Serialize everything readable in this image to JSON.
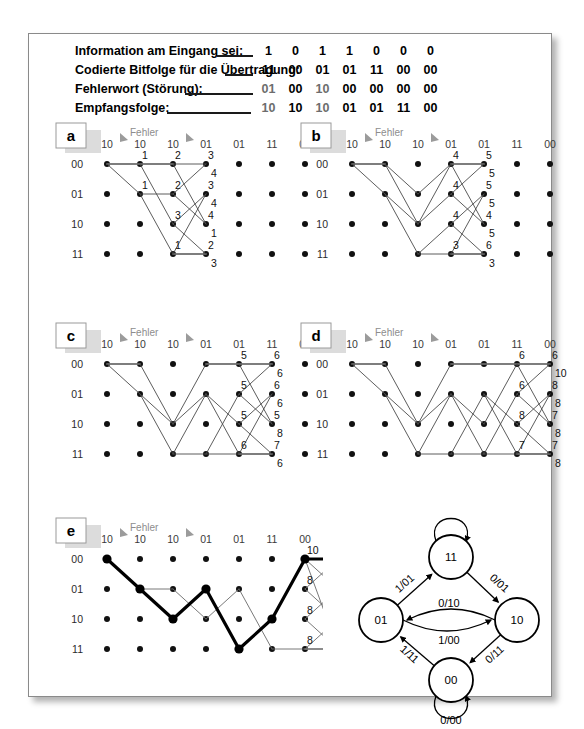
{
  "figure": {
    "legend": {
      "rows": [
        {
          "label": "Information am Eingang sei:",
          "values": [
            "1",
            "0",
            "1",
            "1",
            "0",
            "0",
            "0"
          ],
          "grey": false
        },
        {
          "label": "Codierte Bitfolge für die Übertragung:",
          "values": [
            "11",
            "00",
            "01",
            "01",
            "11",
            "00",
            "00"
          ],
          "grey": false
        },
        {
          "label": "Fehlerwort  (Störung):",
          "values": [
            "01",
            "00",
            "10",
            "00",
            "00",
            "00",
            "00"
          ],
          "grey": true
        },
        {
          "label": "Empfangsfolge:",
          "values": [
            "10",
            "10",
            "10",
            "01",
            "01",
            "11",
            "00"
          ],
          "grey": true
        }
      ]
    },
    "common": {
      "received_sequence": [
        "10",
        "10",
        "10",
        "01",
        "01",
        "11",
        "00"
      ],
      "state_labels": [
        "00",
        "01",
        "10",
        "11"
      ],
      "error_marker_label": "Fehler",
      "error_marker_columns": [
        0,
        2
      ]
    },
    "panels": [
      {
        "tag": "a",
        "metrics": [
          {
            "col": 1,
            "state": 0,
            "value": "1"
          },
          {
            "col": 1,
            "state": 1,
            "value": "1"
          },
          {
            "col": 2,
            "state": 0,
            "value": "2"
          },
          {
            "col": 2,
            "state": 1,
            "value": "2"
          },
          {
            "col": 2,
            "state": 2,
            "value": "3"
          },
          {
            "col": 2,
            "state": 3,
            "value": "1"
          },
          {
            "col": 3,
            "state": 0,
            "value": "3",
            "value2": "4"
          },
          {
            "col": 3,
            "state": 1,
            "value": "3",
            "value2": "4"
          },
          {
            "col": 3,
            "state": 2,
            "value": "4",
            "value2": "1"
          },
          {
            "col": 3,
            "state": 3,
            "value": "2",
            "value2": "3"
          }
        ],
        "nodes": [
          [
            0
          ],
          [
            0,
            1
          ],
          [
            0,
            1,
            2,
            3
          ],
          [
            0,
            1,
            2,
            3
          ]
        ],
        "edges": [
          [
            0,
            0,
            1,
            0
          ],
          [
            0,
            0,
            1,
            1
          ],
          [
            1,
            0,
            2,
            0
          ],
          [
            1,
            0,
            2,
            2
          ],
          [
            1,
            1,
            2,
            1
          ],
          [
            1,
            1,
            2,
            3
          ],
          [
            2,
            0,
            3,
            0
          ],
          [
            2,
            0,
            3,
            2
          ],
          [
            2,
            1,
            3,
            0
          ],
          [
            2,
            1,
            3,
            2
          ],
          [
            2,
            2,
            3,
            1
          ],
          [
            2,
            2,
            3,
            3
          ],
          [
            2,
            3,
            3,
            1
          ],
          [
            2,
            3,
            3,
            3
          ]
        ],
        "flat_edges": [
          [
            0,
            0,
            1,
            0
          ],
          [
            1,
            0,
            2,
            0
          ],
          [
            2,
            3,
            3,
            3
          ]
        ]
      },
      {
        "tag": "b",
        "metrics": [
          {
            "col": 3,
            "state": 0,
            "value": "4"
          },
          {
            "col": 3,
            "state": 1,
            "value": "4"
          },
          {
            "col": 3,
            "state": 2,
            "value": "4"
          },
          {
            "col": 3,
            "state": 3,
            "value": "3"
          },
          {
            "col": 4,
            "state": 0,
            "value": "5",
            "value2": "5"
          },
          {
            "col": 4,
            "state": 1,
            "value": "5",
            "value2": "5"
          },
          {
            "col": 4,
            "state": 2,
            "value": "4",
            "value2": "5"
          },
          {
            "col": 4,
            "state": 3,
            "value": "6",
            "value2": "3"
          }
        ],
        "nodes": [
          [
            0
          ],
          [
            0,
            1
          ],
          [
            0,
            1,
            2,
            3
          ],
          [
            0,
            1,
            2,
            3
          ],
          [
            0,
            1,
            2,
            3
          ]
        ],
        "edges": [
          [
            0,
            0,
            1,
            0
          ],
          [
            0,
            0,
            1,
            1
          ],
          [
            1,
            0,
            2,
            1
          ],
          [
            1,
            0,
            2,
            2
          ],
          [
            1,
            1,
            2,
            2
          ],
          [
            1,
            1,
            2,
            3
          ],
          [
            2,
            1,
            3,
            0
          ],
          [
            2,
            2,
            3,
            0
          ],
          [
            2,
            2,
            3,
            1
          ],
          [
            2,
            3,
            3,
            2
          ],
          [
            2,
            3,
            3,
            3
          ],
          [
            3,
            0,
            4,
            0
          ],
          [
            3,
            0,
            4,
            2
          ],
          [
            3,
            1,
            4,
            0
          ],
          [
            3,
            1,
            4,
            2
          ],
          [
            3,
            2,
            4,
            1
          ],
          [
            3,
            2,
            4,
            3
          ],
          [
            3,
            3,
            4,
            1
          ],
          [
            3,
            3,
            4,
            3
          ]
        ],
        "flat_edges": [
          [
            0,
            0,
            1,
            0
          ],
          [
            3,
            0,
            4,
            0
          ],
          [
            3,
            3,
            4,
            3
          ]
        ]
      },
      {
        "tag": "c",
        "metrics": [
          {
            "col": 4,
            "state": 0,
            "value": "5"
          },
          {
            "col": 4,
            "state": 1,
            "value": "5"
          },
          {
            "col": 4,
            "state": 2,
            "value": "5"
          },
          {
            "col": 4,
            "state": 3,
            "value": "6"
          },
          {
            "col": 5,
            "state": 0,
            "value": "6",
            "value2": "6"
          },
          {
            "col": 5,
            "state": 1,
            "value": "6",
            "value2": "6"
          },
          {
            "col": 5,
            "state": 2,
            "value": "5",
            "value2": "8"
          },
          {
            "col": 5,
            "state": 3,
            "value": "7",
            "value2": "6"
          }
        ],
        "nodes": [
          [
            0
          ],
          [
            0,
            1
          ],
          [
            0,
            1,
            2,
            3
          ],
          [
            0,
            1,
            2,
            3
          ],
          [
            0,
            1,
            2,
            3
          ],
          [
            0,
            1,
            2,
            3
          ]
        ],
        "edges": [
          [
            0,
            0,
            1,
            0
          ],
          [
            0,
            0,
            1,
            1
          ],
          [
            1,
            0,
            2,
            2
          ],
          [
            1,
            1,
            2,
            2
          ],
          [
            1,
            1,
            2,
            3
          ],
          [
            2,
            2,
            3,
            0
          ],
          [
            2,
            2,
            3,
            1
          ],
          [
            2,
            3,
            3,
            1
          ],
          [
            2,
            3,
            3,
            3
          ],
          [
            3,
            0,
            4,
            0
          ],
          [
            3,
            1,
            4,
            2
          ],
          [
            3,
            1,
            4,
            3
          ],
          [
            3,
            3,
            4,
            1
          ],
          [
            3,
            3,
            4,
            3
          ],
          [
            4,
            0,
            5,
            0
          ],
          [
            4,
            0,
            5,
            2
          ],
          [
            4,
            1,
            5,
            0
          ],
          [
            4,
            1,
            5,
            2
          ],
          [
            4,
            2,
            5,
            1
          ],
          [
            4,
            2,
            5,
            3
          ],
          [
            4,
            3,
            5,
            1
          ],
          [
            4,
            3,
            5,
            3
          ]
        ],
        "flat_edges": [
          [
            0,
            0,
            1,
            0
          ],
          [
            3,
            0,
            4,
            0
          ],
          [
            4,
            0,
            5,
            0
          ],
          [
            4,
            3,
            5,
            3
          ]
        ]
      },
      {
        "tag": "d",
        "metrics": [
          {
            "col": 5,
            "state": 0,
            "value": "6"
          },
          {
            "col": 5,
            "state": 1,
            "value": "6"
          },
          {
            "col": 5,
            "state": 2,
            "value": "8"
          },
          {
            "col": 5,
            "state": 3,
            "value": "7"
          },
          {
            "col": 6,
            "state": 0,
            "value": "6",
            "value2": "10"
          },
          {
            "col": 6,
            "state": 1,
            "value": "8",
            "value2": "8"
          },
          {
            "col": 6,
            "state": 2,
            "value": "7",
            "value2": "8"
          },
          {
            "col": 6,
            "state": 3,
            "value": "7",
            "value2": "8"
          }
        ],
        "nodes": [
          [
            0
          ],
          [
            0,
            1
          ],
          [
            0,
            1,
            2,
            3
          ],
          [
            0,
            1,
            2,
            3
          ],
          [
            0,
            1,
            2,
            3
          ],
          [
            0,
            1,
            2,
            3
          ],
          [
            0,
            1,
            2,
            3
          ]
        ],
        "edges": [
          [
            0,
            0,
            1,
            0
          ],
          [
            0,
            0,
            1,
            1
          ],
          [
            1,
            0,
            2,
            2
          ],
          [
            1,
            1,
            2,
            2
          ],
          [
            1,
            1,
            2,
            3
          ],
          [
            2,
            2,
            3,
            0
          ],
          [
            2,
            2,
            3,
            1
          ],
          [
            2,
            3,
            3,
            1
          ],
          [
            2,
            3,
            3,
            3
          ],
          [
            3,
            0,
            4,
            0
          ],
          [
            3,
            1,
            4,
            2
          ],
          [
            3,
            1,
            4,
            3
          ],
          [
            3,
            3,
            4,
            1
          ],
          [
            3,
            3,
            4,
            3
          ],
          [
            4,
            0,
            5,
            0
          ],
          [
            4,
            1,
            5,
            2
          ],
          [
            4,
            1,
            5,
            3
          ],
          [
            4,
            2,
            5,
            0
          ],
          [
            4,
            3,
            5,
            1
          ],
          [
            4,
            3,
            5,
            3
          ],
          [
            5,
            0,
            6,
            0
          ],
          [
            5,
            0,
            6,
            2
          ],
          [
            5,
            1,
            6,
            0
          ],
          [
            5,
            1,
            6,
            2
          ],
          [
            5,
            2,
            6,
            1
          ],
          [
            5,
            2,
            6,
            3
          ],
          [
            5,
            3,
            6,
            1
          ],
          [
            5,
            3,
            6,
            3
          ]
        ],
        "flat_edges": [
          [
            0,
            0,
            1,
            0
          ],
          [
            3,
            0,
            4,
            0
          ],
          [
            4,
            0,
            5,
            0
          ],
          [
            5,
            0,
            6,
            0
          ],
          [
            5,
            3,
            6,
            3
          ]
        ]
      }
    ],
    "panel_e": {
      "tag": "e",
      "metrics": [
        {
          "col": 6,
          "state": 0,
          "value": "10"
        },
        {
          "col": 6,
          "state": 1,
          "value": "8"
        },
        {
          "col": 6,
          "state": 2,
          "value": "8"
        },
        {
          "col": 6,
          "state": 3,
          "value": "8"
        },
        {
          "col": 7,
          "state": 0,
          "value": "12",
          "value2": "8"
        },
        {
          "col": 7,
          "state": 1,
          "value": "10",
          "value2": "10"
        },
        {
          "col": 7,
          "state": 2,
          "value": "9",
          "value2": "9"
        },
        {
          "col": 7,
          "state": 3,
          "value": "9",
          "value2": "9"
        }
      ],
      "thin_edges": [
        [
          0,
          0,
          1,
          1
        ],
        [
          1,
          1,
          2,
          1
        ],
        [
          2,
          1,
          3,
          2
        ],
        [
          3,
          2,
          4,
          1
        ],
        [
          4,
          1,
          5,
          3
        ],
        [
          5,
          3,
          6,
          3
        ],
        [
          6,
          3,
          7,
          2
        ],
        [
          6,
          3,
          7,
          3
        ],
        [
          6,
          1,
          7,
          0
        ],
        [
          6,
          1,
          7,
          2
        ],
        [
          6,
          2,
          7,
          1
        ],
        [
          6,
          2,
          7,
          3
        ],
        [
          6,
          0,
          7,
          1
        ],
        [
          6,
          0,
          7,
          3
        ]
      ],
      "survivor_path": [
        [
          0,
          0
        ],
        [
          1,
          1
        ],
        [
          2,
          2
        ],
        [
          3,
          1
        ],
        [
          4,
          3
        ],
        [
          5,
          2
        ],
        [
          6,
          0
        ],
        [
          7,
          0
        ]
      ],
      "flat_edges": [
        [
          6,
          0,
          7,
          0
        ],
        [
          6,
          3,
          7,
          3
        ]
      ]
    },
    "state_diagram": {
      "states": [
        {
          "id": "s11",
          "label": "11"
        },
        {
          "id": "s01",
          "label": "01"
        },
        {
          "id": "s10",
          "label": "10"
        },
        {
          "id": "s00",
          "label": "00"
        }
      ],
      "transitions": [
        {
          "from": "11",
          "to": "11",
          "label": "1/10"
        },
        {
          "from": "01",
          "to": "11",
          "label": "1/01"
        },
        {
          "from": "11",
          "to": "10",
          "label": "0/01"
        },
        {
          "from": "01",
          "to": "10",
          "label": "0/10"
        },
        {
          "from": "10",
          "to": "01",
          "label": "1/00"
        },
        {
          "from": "00",
          "to": "01",
          "label": "1/11"
        },
        {
          "from": "10",
          "to": "00",
          "label": "0/11"
        },
        {
          "from": "00",
          "to": "00",
          "label": "0/00"
        }
      ]
    },
    "colors": {
      "ink": "#1a1a1a",
      "grey_text": "#8d8d8d",
      "edge": "#4a4a4a",
      "node": "#111111",
      "frame": "#8a8a8a"
    }
  }
}
